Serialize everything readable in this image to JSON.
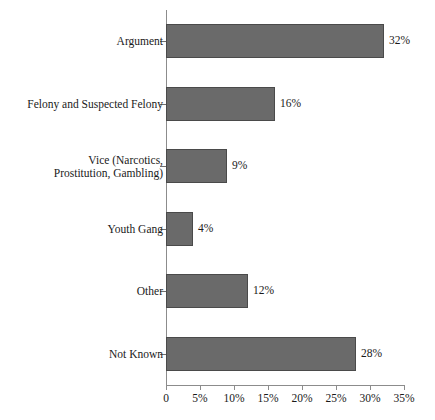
{
  "chart_data": {
    "type": "bar",
    "orientation": "horizontal",
    "title": "",
    "subtitle": "",
    "xlabel": "",
    "ylabel": "",
    "categories": [
      "Argument",
      "Felony and Suspected Felony",
      "Vice (Narcotics,\nProstitution, Gambling)",
      "Youth Gang",
      "Other",
      "Not Known"
    ],
    "values": [
      32,
      16,
      9,
      4,
      12,
      28
    ],
    "data_labels": [
      "32%",
      "16%",
      "9%",
      "4%",
      "12%",
      "28%"
    ],
    "xlim": [
      0,
      35
    ],
    "ylim": [
      0,
      6
    ],
    "xticks": [
      0,
      5,
      10,
      15,
      20,
      25,
      30,
      35
    ],
    "xtick_labels": [
      "0",
      "5%",
      "10%",
      "15%",
      "20%",
      "25%",
      "30%",
      "35%"
    ],
    "grid": false,
    "legend": null,
    "legend_position": "none",
    "colors": {
      "bar_fill": "#6a6a6a",
      "bar_edge": "#4a4a4a",
      "axis": "#8c8c8c",
      "text": "#1a1a1a",
      "background": "#ffffff"
    }
  }
}
